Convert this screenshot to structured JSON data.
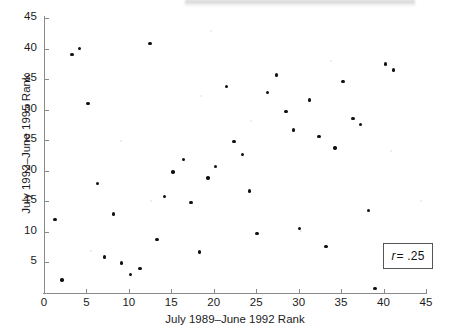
{
  "figure": {
    "kind": "scatterplot",
    "annotation_box": {
      "symbol": "r",
      "equals": "=",
      "value": ".25",
      "full_text": "r = .25"
    }
  },
  "chart_data": {
    "type": "scatter",
    "title": "",
    "subtitle": "",
    "xlabel": "July 1989–June 1992 Rank",
    "ylabel": "July 1992–June 1995 Rank",
    "xlim": [
      0,
      45
    ],
    "ylim": [
      0,
      45
    ],
    "xticks": [
      0,
      5,
      10,
      15,
      20,
      25,
      30,
      35,
      40,
      45
    ],
    "yticks": [
      5,
      10,
      15,
      20,
      25,
      30,
      35,
      40,
      45
    ],
    "xtick_labels": [
      "0",
      "5",
      "10",
      "15",
      "20",
      "25",
      "30",
      "35",
      "40",
      "45"
    ],
    "ytick_labels": [
      "5",
      "10",
      "15",
      "20",
      "25",
      "30",
      "35",
      "40",
      "45"
    ],
    "grid": false,
    "legend": null,
    "marker": "filled-circle",
    "marker_color": "#111111",
    "annotations": [
      {
        "text": "r = .25",
        "boxed": true,
        "position": "lower-right"
      }
    ],
    "correlation_r": 0.25,
    "n_points": 41,
    "points": [
      [
        1.3,
        12.0
      ],
      [
        2.1,
        2.1
      ],
      [
        3.3,
        39.0
      ],
      [
        4.2,
        40.0
      ],
      [
        5.2,
        31.0
      ],
      [
        6.3,
        17.9
      ],
      [
        7.1,
        5.9
      ],
      [
        8.2,
        12.9
      ],
      [
        9.1,
        4.9
      ],
      [
        10.2,
        3.0
      ],
      [
        11.3,
        4.0
      ],
      [
        12.5,
        40.8
      ],
      [
        13.3,
        8.8
      ],
      [
        14.2,
        15.8
      ],
      [
        15.2,
        19.8
      ],
      [
        16.4,
        21.8
      ],
      [
        17.3,
        14.8
      ],
      [
        18.3,
        6.7
      ],
      [
        19.3,
        18.8
      ],
      [
        20.2,
        20.7
      ],
      [
        21.5,
        33.8
      ],
      [
        22.4,
        24.8
      ],
      [
        23.4,
        22.7
      ],
      [
        24.2,
        16.7
      ],
      [
        25.1,
        9.7
      ],
      [
        26.3,
        32.8
      ],
      [
        27.4,
        35.7
      ],
      [
        28.5,
        29.7
      ],
      [
        29.4,
        26.7
      ],
      [
        30.1,
        10.6
      ],
      [
        31.3,
        31.6
      ],
      [
        32.4,
        25.6
      ],
      [
        33.2,
        7.6
      ],
      [
        34.3,
        23.7
      ],
      [
        35.2,
        34.6
      ],
      [
        36.4,
        28.6
      ],
      [
        37.3,
        27.6
      ],
      [
        38.2,
        13.5
      ],
      [
        39.0,
        0.7
      ],
      [
        40.2,
        37.5
      ],
      [
        41.2,
        36.5
      ]
    ]
  }
}
